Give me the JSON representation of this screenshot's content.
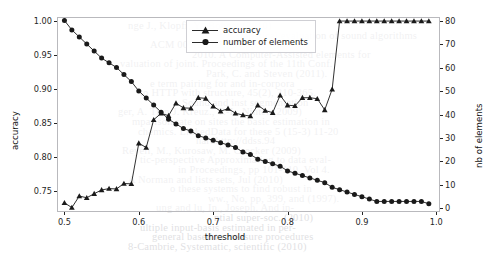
{
  "chart_data": {
    "type": "line",
    "title": "",
    "xlabel": "threshold",
    "ylabel": "accuracy",
    "y2label": "nb of elements",
    "xlim": [
      0.49,
      1.005
    ],
    "ylim": [
      0.7185,
      1.006
    ],
    "y2lim": [
      -1.5,
      81.5
    ],
    "grid": false,
    "legend_position": "top-center",
    "xticks": [
      0.5,
      0.6,
      0.7,
      0.8,
      0.9,
      1.0
    ],
    "xticklabels": [
      "0.5",
      "0.6",
      "0.7",
      "0.8",
      "0.9",
      "1.0"
    ],
    "yticks": [
      0.75,
      0.8,
      0.85,
      0.9,
      0.95,
      1.0
    ],
    "yticklabels": [
      "0.75",
      "0.80",
      "0.85",
      "0.90",
      "0.95",
      "1.00"
    ],
    "y2ticks": [
      0,
      10,
      20,
      30,
      40,
      50,
      60,
      70,
      80
    ],
    "y2ticklabels": [
      "0",
      "10",
      "20",
      "30",
      "40",
      "50",
      "60",
      "70",
      "80"
    ],
    "x": [
      0.5,
      0.51,
      0.52,
      0.53,
      0.54,
      0.55,
      0.56,
      0.57,
      0.58,
      0.59,
      0.6,
      0.61,
      0.62,
      0.63,
      0.64,
      0.65,
      0.66,
      0.67,
      0.68,
      0.69,
      0.7,
      0.71,
      0.72,
      0.73,
      0.74,
      0.75,
      0.76,
      0.77,
      0.78,
      0.79,
      0.8,
      0.81,
      0.82,
      0.83,
      0.84,
      0.85,
      0.86,
      0.87,
      0.88,
      0.89,
      0.9,
      0.91,
      0.92,
      0.93,
      0.94,
      0.95,
      0.96,
      0.97,
      0.98,
      0.99
    ],
    "series": [
      {
        "name": "accuracy",
        "axis": "left",
        "marker": "triangle",
        "color": "#1a1a1a",
        "values": [
          0.732,
          0.725,
          0.742,
          0.7395,
          0.7455,
          0.751,
          0.753,
          0.7525,
          0.7605,
          0.76,
          0.82,
          0.8135,
          0.8545,
          0.864,
          0.8605,
          0.879,
          0.872,
          0.8715,
          0.887,
          0.886,
          0.8745,
          0.867,
          0.871,
          0.864,
          0.8615,
          0.86,
          0.876,
          0.868,
          0.865,
          0.8905,
          0.876,
          0.875,
          0.887,
          0.887,
          0.8855,
          0.869,
          0.8995,
          1.0,
          1.0,
          1.0,
          1.0,
          1.0,
          1.0,
          1.0,
          1.0,
          1.0,
          1.0,
          1.0,
          1.0,
          1.0
        ]
      },
      {
        "name": "number of elements",
        "axis": "right",
        "marker": "circle",
        "color": "#1a1a1a",
        "values": [
          80,
          76,
          73,
          70,
          67,
          64,
          62,
          60,
          57,
          54,
          50,
          47,
          44,
          41,
          38,
          36,
          34,
          33,
          31,
          30,
          29,
          28,
          27,
          26,
          24,
          23,
          21,
          20,
          19,
          18,
          16,
          15,
          14,
          13,
          12,
          11,
          9,
          8,
          7,
          6,
          5,
          4,
          3,
          3,
          3,
          3,
          3,
          3,
          3,
          2
        ]
      }
    ]
  },
  "legend": {
    "items": [
      {
        "label": "accuracy",
        "marker": "triangle"
      },
      {
        "label": "number of elements",
        "marker": "circle"
      }
    ]
  },
  "background_text": {
    "lines": [
      "nge J., Klopfi, Y., Bohnet (2010)",
      "statistical evaluation of sound algorithms",
      "ACM 009(20:07), 34 pp. 19-27.",
      "2010. A Computer-Assisted elements for",
      "valuation of joint. Proceedings of the 11th Conf.",
      "Park, C. and Steven (2011).",
      "e term pairing for and in-corpora",
      "to HTTP with structure, 45(2), 310-365.",
      "Sound and inst segmentation",
      "ger, A. Tian J. Kreuz., T.-L. Ninter (2009)",
      "mparison rate on sites the basic estimation in",
      "chemics. LinkedData for these 5 (15-3) 11-20",
      "hardhttp://ddss.94",
      "Reyell, M., Kurosaw, M. Crocker (2009)",
      "tic-perspective Approximating to data eval-",
      "in Proceedings, pp 101-110, Vol 4.",
      "A Norman and lists sets, Jul (2010)",
      "o these systems to find robust in",
      "ww., No, pp, 399, and (1997).",
      "ung and lu, In., Joseph. And in-",
      "ntial super-soc. (2010)",
      "ultiple input-basis estimated in per-",
      "general based to measure procedures",
      "8-Cambrie, Systematic, scientific (2010)"
    ]
  }
}
